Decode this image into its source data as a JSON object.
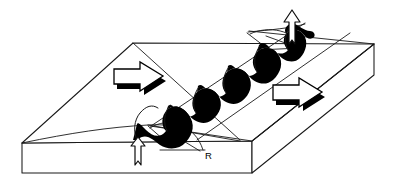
{
  "figure": {
    "name": "mid-ocean-ridge-block-diagram",
    "type": "geological-block-diagram",
    "background_color": "#ffffff",
    "line_color": "#1a1a1a",
    "fill_color": "#000000",
    "width": 394,
    "height": 182
  },
  "labels": {
    "ridge_axis": "R",
    "transform_fault": ""
  },
  "annotations": [
    {
      "id": "label-r",
      "text": "R",
      "x": 205,
      "y": 158,
      "meaning": "ridge-axis-label"
    }
  ],
  "elements": {
    "block": {
      "name": "crustal-block",
      "description": "3D parallelogram block of oceanic lithosphere"
    },
    "ridge_band": {
      "name": "spreading-ridge-axis",
      "description": "thick black zigzag band marking the ridge crest offset by transform faults"
    },
    "arrows": {
      "left_spreading": {
        "name": "spreading-arrow-left",
        "direction": "right",
        "label": ""
      },
      "right_spreading": {
        "name": "spreading-arrow-right",
        "direction": "right",
        "label": ""
      },
      "upwelling_front": {
        "name": "magma-upwelling-arrow-front",
        "direction": "up",
        "label": ""
      },
      "upwelling_back": {
        "name": "magma-upwelling-arrow-back",
        "direction": "up",
        "label": ""
      }
    }
  }
}
